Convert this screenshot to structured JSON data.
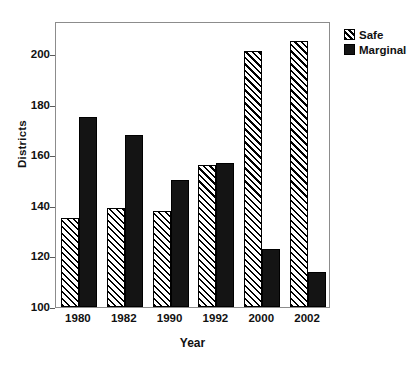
{
  "chart_data": {
    "type": "bar",
    "title": "",
    "subtitle": "",
    "xlabel": "Year",
    "ylabel": "Districts",
    "categories": [
      "1980",
      "1982",
      "1990",
      "1992",
      "2000",
      "2002"
    ],
    "series": [
      {
        "name": "Safe",
        "values": [
          135,
          139,
          138,
          156,
          201,
          205
        ]
      },
      {
        "name": "Marginal",
        "values": [
          175,
          168,
          150,
          157,
          123,
          114
        ]
      }
    ],
    "ylim": [
      100,
      213
    ],
    "yticks": [
      100,
      120,
      140,
      160,
      180,
      200
    ],
    "ytick_labels": [
      "100",
      "120",
      "140",
      "160",
      "180",
      "200"
    ],
    "grid": false,
    "legend_position": "top-right",
    "legend_entries": [
      "Safe",
      "Marginal"
    ],
    "colors": {
      "safe_fill": "#ffffff",
      "safe_hatch": "#000000",
      "marginal_fill": "#141414",
      "axis": "#8c8c8c",
      "text": "#111111",
      "background": "#ffffff"
    },
    "annotations": []
  },
  "axes": {
    "y_title": "Districts",
    "x_title": "Year"
  },
  "legend": {
    "items": [
      {
        "label": "Safe",
        "pattern": "diagonal-hatch"
      },
      {
        "label": "Marginal",
        "pattern": "solid-black"
      }
    ]
  }
}
